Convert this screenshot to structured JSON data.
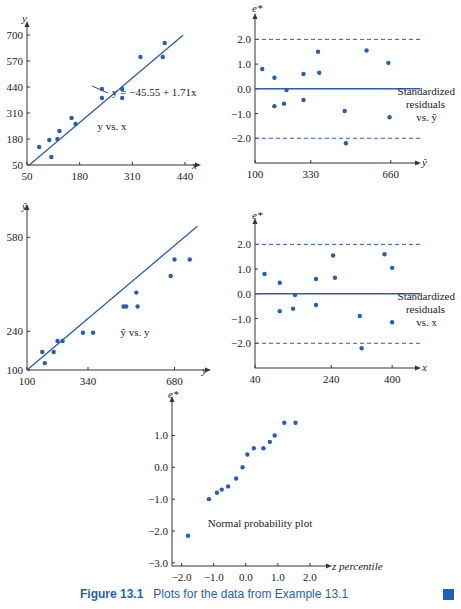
{
  "caption": {
    "number": "Figure 13.1",
    "text": "Plots for the data from Example 13.1"
  },
  "chart_data": [
    {
      "type": "scatter",
      "title": "y vs. x",
      "xlabel": "x",
      "ylabel": "y",
      "xticks": [
        50,
        180,
        310,
        440
      ],
      "yticks": [
        50,
        180,
        310,
        440,
        570,
        700
      ],
      "annotation": "y = −45.55 + 1.71x",
      "x": [
        80,
        110,
        105,
        125,
        130,
        160,
        170,
        235,
        235,
        285,
        285,
        330,
        385,
        390
      ],
      "y": [
        140,
        90,
        175,
        180,
        220,
        285,
        255,
        430,
        385,
        430,
        385,
        590,
        590,
        660
      ],
      "fit": {
        "intercept": -45.55,
        "slope": 1.71
      }
    },
    {
      "type": "scatter",
      "title": "Standardized residuals vs. ŷ",
      "xlabel": "ŷ",
      "ylabel": "e*",
      "xticks": [
        100,
        330,
        660
      ],
      "yticks": [
        -2.0,
        -1.0,
        0.0,
        1.0,
        2.0
      ],
      "x": [
        130,
        180,
        180,
        220,
        230,
        300,
        300,
        360,
        365,
        470,
        475,
        560,
        650,
        655
      ],
      "y": [
        0.8,
        0.45,
        -0.7,
        -0.6,
        -0.05,
        0.6,
        -0.45,
        1.5,
        0.65,
        -0.9,
        -2.2,
        1.55,
        1.05,
        -1.15
      ],
      "reference_lines": [
        2.0,
        0.0,
        -2.0
      ]
    },
    {
      "type": "scatter",
      "title": "ŷ vs. y",
      "xlabel": "y",
      "ylabel": "ŷ",
      "xticks": [
        100,
        340,
        680
      ],
      "yticks": [
        100,
        240,
        580
      ],
      "x": [
        160,
        170,
        205,
        220,
        240,
        320,
        360,
        480,
        490,
        530,
        535,
        665,
        680,
        740
      ],
      "y": [
        165,
        125,
        165,
        205,
        205,
        235,
        235,
        330,
        330,
        380,
        330,
        440,
        500,
        500
      ]
    },
    {
      "type": "scatter",
      "title": "Standardized residuals vs. x",
      "xlabel": "x",
      "ylabel": "e*",
      "xticks": [
        40,
        240,
        400
      ],
      "yticks": [
        -2.0,
        -1.0,
        0.0,
        1.0,
        2.0
      ],
      "x": [
        65,
        105,
        105,
        140,
        145,
        200,
        200,
        245,
        250,
        315,
        320,
        380,
        400,
        400
      ],
      "y": [
        0.8,
        0.45,
        -0.7,
        -0.6,
        -0.05,
        0.6,
        -0.45,
        1.55,
        0.65,
        -0.9,
        -2.2,
        1.6,
        1.05,
        -1.15
      ],
      "reference_lines": [
        2.0,
        0.0,
        -2.0
      ]
    },
    {
      "type": "scatter",
      "title": "Normal probability plot",
      "xlabel": "z percentile",
      "ylabel": "e*",
      "xticks": [
        -2.0,
        -1.0,
        0.0,
        1.0,
        2.0
      ],
      "yticks": [
        -3.0,
        -2.0,
        -1.0,
        0.0,
        1.0
      ],
      "x": [
        -1.8,
        -1.15,
        -0.9,
        -0.75,
        -0.55,
        -0.3,
        -0.1,
        0.05,
        0.25,
        0.55,
        0.75,
        0.9,
        1.2,
        1.55
      ],
      "y": [
        -2.15,
        -1.0,
        -0.8,
        -0.7,
        -0.6,
        -0.35,
        0.0,
        0.4,
        0.6,
        0.6,
        0.8,
        1.0,
        1.4,
        1.4
      ]
    }
  ]
}
